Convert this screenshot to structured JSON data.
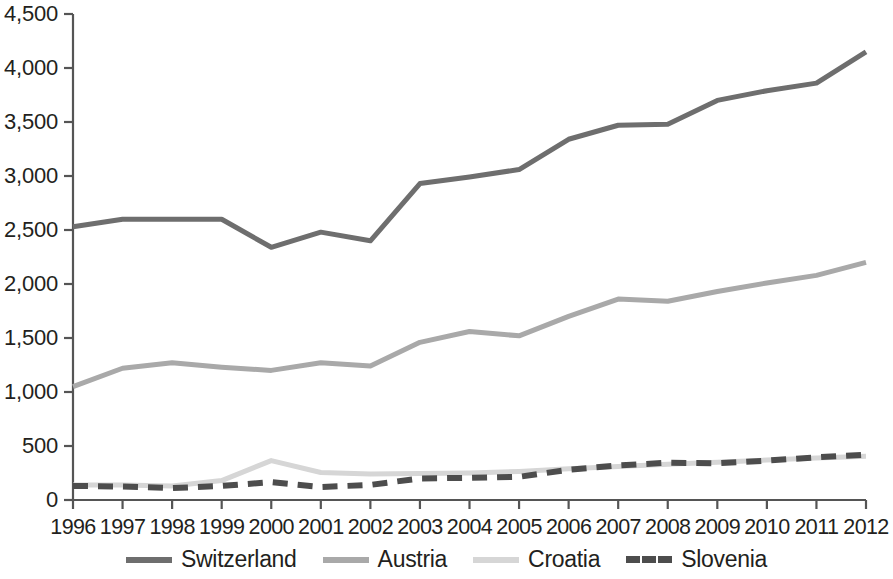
{
  "chart_data": {
    "type": "line",
    "title": "",
    "subtitle": "",
    "xlabel": "",
    "ylabel": "",
    "x": [
      1996,
      1997,
      1998,
      1999,
      2000,
      2001,
      2002,
      2003,
      2004,
      2005,
      2006,
      2007,
      2008,
      2009,
      2010,
      2011,
      2012
    ],
    "categories": [
      "1996",
      "1997",
      "1998",
      "1999",
      "2000",
      "2001",
      "2002",
      "2003",
      "2004",
      "2005",
      "2006",
      "2007",
      "2008",
      "2009",
      "2010",
      "2011",
      "2012"
    ],
    "xlim": [
      1996,
      2012
    ],
    "ylim": [
      0,
      4500
    ],
    "yticks": [
      0,
      500,
      1000,
      1500,
      2000,
      2500,
      3000,
      3500,
      4000,
      4500
    ],
    "ytick_labels": [
      "0",
      "500",
      "1,000",
      "1,500",
      "2,000",
      "2,500",
      "3,000",
      "3,500",
      "4,000",
      "4,500"
    ],
    "grid": false,
    "legend_position": "bottom",
    "series": [
      {
        "name": "Switzerland",
        "color": "#6e6e6e",
        "style": "solid",
        "width": 5,
        "values": [
          2530,
          2600,
          2600,
          2600,
          2340,
          2480,
          2400,
          2930,
          2990,
          3060,
          3340,
          3470,
          3480,
          3700,
          3790,
          3860,
          4150
        ]
      },
      {
        "name": "Austria",
        "color": "#a9a9a9",
        "style": "solid",
        "width": 5,
        "values": [
          1050,
          1220,
          1270,
          1230,
          1200,
          1270,
          1240,
          1460,
          1560,
          1520,
          1700,
          1860,
          1840,
          1930,
          2010,
          2080,
          2200
        ]
      },
      {
        "name": "Croatia",
        "color": "#d6d6d6",
        "style": "solid",
        "width": 5,
        "values": [
          140,
          140,
          130,
          180,
          365,
          255,
          240,
          245,
          250,
          265,
          290,
          310,
          330,
          350,
          370,
          390,
          405
        ]
      },
      {
        "name": "Slovenia",
        "color": "#4d4d4d",
        "style": "dashed",
        "width": 6,
        "values": [
          130,
          125,
          110,
          130,
          165,
          120,
          140,
          200,
          205,
          215,
          280,
          320,
          345,
          340,
          365,
          395,
          420
        ]
      }
    ]
  },
  "legend": {
    "items": [
      {
        "label": "Switzerland",
        "name": "legend-item-switzerland"
      },
      {
        "label": "Austria",
        "name": "legend-item-austria"
      },
      {
        "label": "Croatia",
        "name": "legend-item-croatia"
      },
      {
        "label": "Slovenia",
        "name": "legend-item-slovenia"
      }
    ]
  }
}
